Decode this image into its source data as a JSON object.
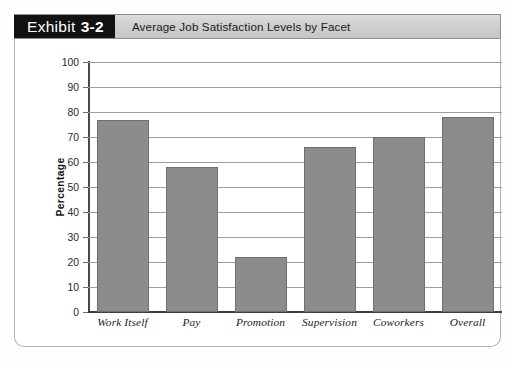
{
  "exhibit": {
    "word": "Exhibit",
    "number": "3-2",
    "title": "Average Job Satisfaction Levels by Facet"
  },
  "chart_data": {
    "type": "bar",
    "title": "Average Job Satisfaction Levels by Facet",
    "xlabel": "",
    "ylabel": "Percentage",
    "ylim": [
      0,
      100
    ],
    "ytick_step": 10,
    "yticks": [
      0,
      10,
      20,
      30,
      40,
      50,
      60,
      70,
      80,
      90,
      100
    ],
    "ytick_labels": [
      "0",
      "10",
      "20",
      "30",
      "40",
      "50",
      "60",
      "70",
      "80",
      "90",
      "100"
    ],
    "grid": true,
    "legend": false,
    "bar_color": "#8c8c8c",
    "bar_edge_color": "#6f6f6f",
    "categories": [
      "Work Itself",
      "Pay",
      "Promotion",
      "Supervision",
      "Coworkers",
      "Overall"
    ],
    "values": [
      77,
      58,
      22,
      66,
      70,
      78
    ]
  },
  "colors": {
    "tag_background": "#111111",
    "tag_text": "#ffffff",
    "title_strip": "#cfcfcf",
    "frame_border": "#b4b4b4",
    "gridline": "#9e9e9e",
    "axis": "#4a4a4a",
    "label_highlight": "#c3c3c3"
  }
}
